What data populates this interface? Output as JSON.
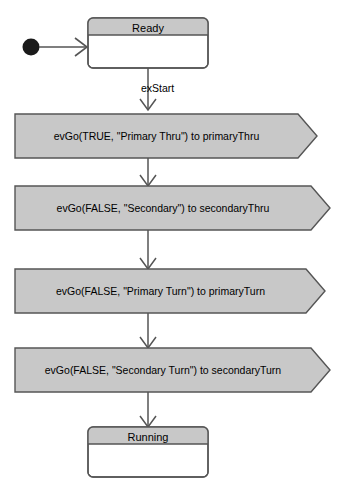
{
  "diagram": {
    "type": "uml-state-machine",
    "title": "",
    "colors": {
      "shape_fill": "#c8c8c8",
      "shape_stroke": "#555555",
      "state_body_fill": "#ffffff",
      "connector_stroke": "#555555",
      "initial_node_fill": "#1a1a1a",
      "text": "#000000",
      "background": "#ffffff"
    },
    "initial_state": {
      "name": "initial-pseudostate",
      "label": ""
    },
    "states": [
      {
        "id": "ready",
        "label": "Ready",
        "has_compartment": true
      },
      {
        "id": "running",
        "label": "Running",
        "has_compartment": true
      }
    ],
    "edge_labels": [
      {
        "id": "exStart",
        "label": "exStart"
      }
    ],
    "transitions": [
      {
        "id": "primary-thru",
        "label": "evGo(TRUE, \"Primary Thru\") to primaryThru"
      },
      {
        "id": "secondary-thru",
        "label": "evGo(FALSE, \"Secondary\") to secondaryThru"
      },
      {
        "id": "primary-turn",
        "label": "evGo(FALSE, \"Primary Turn\") to primaryTurn"
      },
      {
        "id": "secondary-turn",
        "label": "evGo(FALSE, \"Secondary Turn\") to secondaryTurn"
      }
    ]
  }
}
